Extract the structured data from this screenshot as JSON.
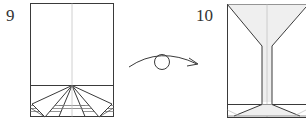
{
  "diagram": {
    "type": "origami-instructions",
    "steps": [
      {
        "number": "9",
        "description": "Paper with bottom folded flaps forming a fan of triangles"
      },
      {
        "number": "10",
        "description": "Result after turning over: martini-glass shape with shaded bowl and stem"
      }
    ],
    "transition": {
      "symbol": "turn-over-arrow",
      "meaning": "turn the model over"
    },
    "colors": {
      "line": "#3a3a3a",
      "crease": "#bdbdbd",
      "shade": "#eeeeee",
      "background": "#ffffff"
    }
  }
}
